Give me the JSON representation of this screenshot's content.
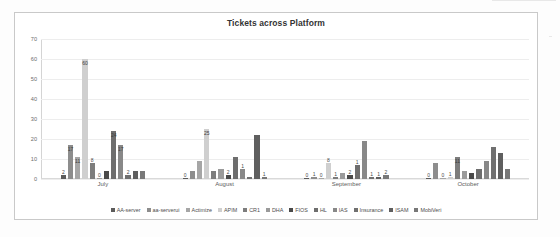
{
  "chart_data": {
    "type": "bar",
    "title": "Tickets across Platform",
    "xlabel": "",
    "ylabel": "",
    "ylim": [
      0,
      70
    ],
    "ytick_values": [
      70,
      60,
      50,
      40,
      30,
      20,
      10,
      0
    ],
    "ytick_labels": [
      "70",
      "60",
      "50",
      "40",
      "30",
      "20",
      "10",
      "0"
    ],
    "grid": true,
    "legend_position": "bottom",
    "categories": [
      "July",
      "August",
      "September",
      "October"
    ],
    "series": [
      {
        "name": "AA-server",
        "color": "#5b5b5b",
        "values": [
          2,
          0,
          0,
          0
        ]
      },
      {
        "name": "aa-serverui",
        "color": "#8d8d8d",
        "values": [
          17,
          4,
          1,
          8
        ]
      },
      {
        "name": "Actimize",
        "color": "#a6a6a6",
        "values": [
          11,
          9,
          0,
          0
        ]
      },
      {
        "name": "APIM",
        "color": "#cfcfcf",
        "values": [
          60,
          25,
          8,
          1
        ]
      },
      {
        "name": "CR1",
        "color": "#7d7d7d",
        "values": [
          8,
          4,
          1,
          11
        ]
      },
      {
        "name": "DHA",
        "color": "#9a9a9a",
        "values": [
          0,
          5,
          3,
          4
        ]
      },
      {
        "name": "FIOS",
        "color": "#4a4a4a",
        "values": [
          4,
          2,
          2,
          3
        ]
      },
      {
        "name": "HL",
        "color": "#6e6e6e",
        "values": [
          24,
          11,
          7,
          5
        ]
      },
      {
        "name": "IAS",
        "color": "#888888",
        "values": [
          17,
          5,
          19,
          9
        ]
      },
      {
        "name": "Insurance",
        "color": "#707070",
        "values": [
          2,
          1,
          1,
          16
        ]
      },
      {
        "name": "ISAM",
        "color": "#5f5f5f",
        "values": [
          4,
          22,
          1,
          13
        ]
      },
      {
        "name": "MobiVeri",
        "color": "#787878",
        "values": [
          4,
          1,
          2,
          5
        ]
      }
    ],
    "data_labels": {
      "July": [
        "2",
        "17",
        "11",
        "60",
        "8",
        "0",
        "",
        "24",
        "17",
        "2",
        "",
        ""
      ],
      "August": [
        "0",
        "",
        "",
        "25",
        "",
        "",
        "2",
        "",
        "1",
        "",
        "",
        "1"
      ],
      "September": [
        "0",
        "1",
        "0",
        "8",
        "1",
        "",
        "2",
        "1",
        "",
        "1",
        "1",
        "2"
      ],
      "October": [
        "0",
        "",
        "0",
        "1",
        "11",
        "",
        "",
        "",
        "",
        "",
        "",
        ""
      ]
    }
  }
}
